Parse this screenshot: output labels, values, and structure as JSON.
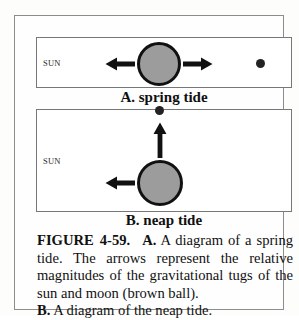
{
  "figure": {
    "panel_a": {
      "sun_label": "SUN",
      "caption": "A. spring tide",
      "earth_name": "earth",
      "moon_name": "moon",
      "arrow_left": "left-arrow",
      "arrow_right": "right-arrow",
      "earth_fill": "#9c9c9c",
      "earth_outline": "#111111",
      "moon_color": "#232323"
    },
    "panel_b": {
      "sun_label": "SUN",
      "caption": "B. neap tide",
      "arrow_left": "left-arrow",
      "arrow_up": "up-arrow"
    },
    "caption": {
      "label": "FIGURE",
      "number": "4-59.",
      "part_a_marker": "A.",
      "part_a_text": "A diagram of a spring tide. The arrows represent the relative magnitudes of the gravitational tugs of the sun and moon (brown ball).",
      "part_b_marker": "B.",
      "part_b_text": "A diagram of the neap tide."
    }
  }
}
